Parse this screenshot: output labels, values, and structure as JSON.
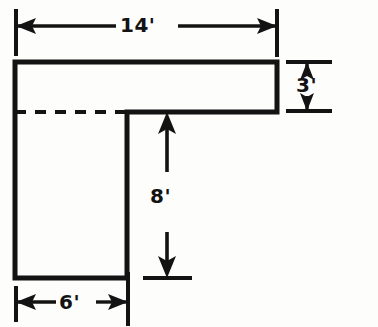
{
  "figure": {
    "background_color": "#fdfdfc",
    "line_color": "#131313",
    "units": "feet",
    "shape": {
      "name": "l-shape-outline",
      "type": "L-polygon",
      "vertices_px": [
        [
          15,
          62
        ],
        [
          277,
          62
        ],
        [
          277,
          112
        ],
        [
          127,
          112
        ],
        [
          127,
          278
        ],
        [
          15,
          278
        ]
      ],
      "hidden_edge_px": [
        [
          15,
          112
        ],
        [
          127,
          112
        ]
      ],
      "hidden_edge_style": "dashed"
    },
    "dimensions": [
      {
        "name": "dimension-14",
        "label": "14'",
        "value": 14,
        "unit": "ft",
        "orientation": "horizontal",
        "position": "top",
        "arrow_style": "double-ended",
        "extends_from_px": 15,
        "extends_to_px": 277,
        "line_y_px": 26
      },
      {
        "name": "dimension-3",
        "label": "3'",
        "value": 3,
        "unit": "ft",
        "orientation": "vertical",
        "position": "right",
        "arrow_style": "double-ended",
        "extends_from_px": 62,
        "extends_to_px": 111,
        "line_x_px": 307
      },
      {
        "name": "dimension-8",
        "label": "8'",
        "value": 8,
        "unit": "ft",
        "orientation": "vertical",
        "position": "interior",
        "arrow_style": "double-ended-broken",
        "extends_from_px": 112,
        "extends_to_px": 278,
        "line_x_px": 167
      },
      {
        "name": "dimension-6",
        "label": "6'",
        "value": 6,
        "unit": "ft",
        "orientation": "horizontal",
        "position": "bottom",
        "arrow_style": "double-ended",
        "extends_from_px": 15,
        "extends_to_px": 127,
        "line_y_px": 302
      }
    ]
  }
}
